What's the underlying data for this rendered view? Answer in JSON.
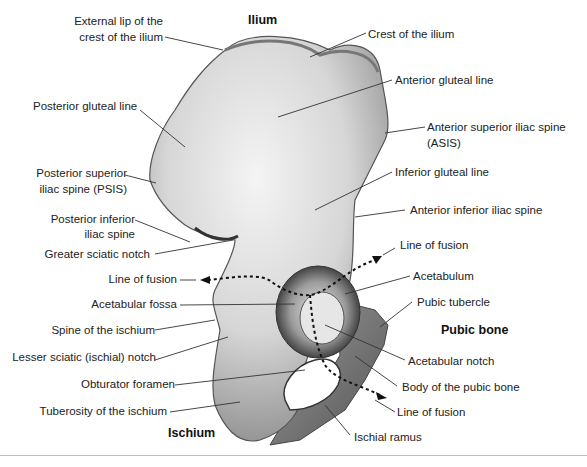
{
  "figure": {
    "regions": {
      "ilium": "Ilium",
      "pubic_bone": "Pubic bone",
      "ischium": "Ischium"
    },
    "labels": {
      "external_lip_1": "External lip of the",
      "external_lip_2": "crest of the ilium",
      "crest_of_ilium": "Crest of the ilium",
      "anterior_gluteal_line": "Anterior gluteal line",
      "posterior_gluteal_line": "Posterior gluteal line",
      "asis_1": "Anterior superior iliac spine",
      "asis_2": "(ASIS)",
      "psis_1": "Posterior superior",
      "psis_2": "iliac spine (PSIS)",
      "inferior_gluteal_line": "Inferior gluteal line",
      "aiis": "Anterior inferior iliac spine",
      "piis_1": "Posterior inferior",
      "piis_2": "iliac spine",
      "greater_sciatic_notch": "Greater sciatic notch",
      "line_of_fusion_right_top": "Line of fusion",
      "line_of_fusion_left": "Line of fusion",
      "acetabulum": "Acetabulum",
      "acetabular_fossa": "Acetabular fossa",
      "pubic_tubercle": "Pubic tubercle",
      "spine_of_ischium": "Spine of the ischium",
      "lesser_sciatic_notch": "Lesser sciatic (ischial) notch",
      "acetabular_notch": "Acetabular notch",
      "obturator_foramen": "Obturator foramen",
      "body_of_pubic_bone": "Body of the pubic bone",
      "tuberosity_of_ischium": "Tuberosity of the ischium",
      "line_of_fusion_bottom": "Line of fusion",
      "ischial_ramus": "Ischial ramus"
    }
  }
}
